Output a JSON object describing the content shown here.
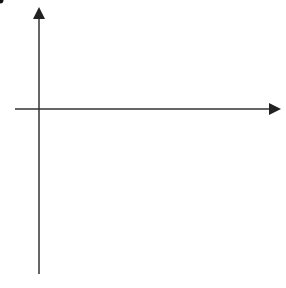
{
  "diagram": {
    "axes": {
      "x_label": "x",
      "y_label": "y",
      "origin_label": "0",
      "x_ticks": [
        "1",
        "2",
        "3",
        "4",
        "5",
        "6",
        "7",
        "8",
        "9"
      ],
      "y_ticks_positive": [
        "1",
        "2",
        "3"
      ],
      "y_ticks_negative": [
        "−1",
        "−2",
        "−3",
        "−4",
        "−5",
        "−6"
      ],
      "x_range": [
        -1,
        9.5
      ],
      "y_range": [
        -7,
        3.6
      ]
    },
    "shapes": [
      {
        "name": "A",
        "vertices": [
          [
            6,
            3
          ],
          [
            6,
            1
          ],
          [
            9,
            1
          ]
        ]
      },
      {
        "name": "B",
        "vertices": [
          [
            2,
            -3
          ],
          [
            4,
            -3
          ],
          [
            2,
            -6
          ]
        ]
      }
    ],
    "shape_labels": {
      "A": "A",
      "B": "B"
    },
    "construction_lines_solid": [
      {
        "from": [
          6,
          3
        ],
        "to": [
          4,
          -3
        ]
      },
      {
        "from": [
          6,
          1
        ],
        "to": [
          2,
          -3
        ]
      }
    ],
    "dashed_lines": [
      {
        "from": [
          1.2,
          1.9
        ],
        "to": [
          8.8,
          -5.6
        ],
        "slope": -1
      },
      {
        "from": [
          1.2,
          1.3
        ],
        "to": [
          9.4,
          -1.5
        ],
        "slope": -0.333
      }
    ],
    "marked_point": {
      "coords": [
        2,
        1
      ]
    },
    "colors": {
      "grid": "#c8c8c8",
      "axis": "#333333",
      "shape": "#222222",
      "background": "#ffffff"
    }
  }
}
